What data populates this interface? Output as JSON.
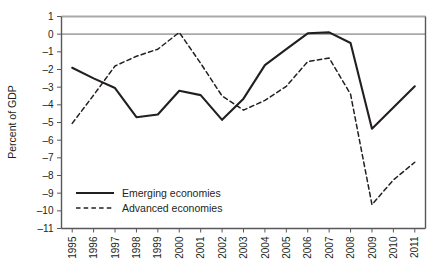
{
  "chart_data": {
    "type": "line",
    "title": "",
    "xlabel": "",
    "ylabel": "Percent of GDP",
    "categories": [
      "1995",
      "1996",
      "1997",
      "1998",
      "1999",
      "2000",
      "2001",
      "2002",
      "2003",
      "2004",
      "2005",
      "2006",
      "2007",
      "2008",
      "2009",
      "2010",
      "2011"
    ],
    "ylim": [
      -11,
      1
    ],
    "y_ticks": [
      "1",
      "0",
      "–1",
      "–2",
      "–3",
      "–4",
      "–5",
      "–6",
      "–7",
      "–8",
      "–9",
      "–10",
      "–11"
    ],
    "y_tick_values": [
      1,
      0,
      -1,
      -2,
      -3,
      -4,
      -5,
      -6,
      -7,
      -8,
      -9,
      -10,
      -11
    ],
    "grid": false,
    "zero_line": true,
    "legend_position": "bottom-left",
    "series": [
      {
        "name": "Emerging economies",
        "style": "solid",
        "color": "#231f20",
        "values": [
          -1.9,
          -2.5,
          -3.05,
          -4.7,
          -4.55,
          -3.2,
          -3.45,
          -4.85,
          -3.65,
          -1.75,
          -0.85,
          0.05,
          0.1,
          -0.5,
          -5.35,
          -4.15,
          -2.95
        ]
      },
      {
        "name": "Advanced economies",
        "style": "dashed",
        "color": "#231f20",
        "values": [
          -5.05,
          -3.45,
          -1.8,
          -1.25,
          -0.85,
          0.1,
          -1.65,
          -3.5,
          -4.3,
          -3.75,
          -2.95,
          -1.55,
          -1.35,
          -3.4,
          -9.65,
          -8.25,
          -7.25
        ]
      }
    ]
  },
  "legend": {
    "items": [
      {
        "label": "Emerging economies",
        "style": "solid"
      },
      {
        "label": "Advanced economies",
        "style": "dashed"
      }
    ]
  },
  "colors": {
    "ink": "#231f20",
    "axis": "#58585b",
    "zero_line": "#a7a9ac",
    "top_border": "#a7a9ac",
    "background": "#ffffff"
  }
}
